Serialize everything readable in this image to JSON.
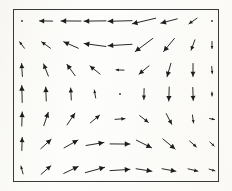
{
  "figure": {
    "title": "",
    "background_color": "#fdfdfb",
    "border_color": "#3a3a3a",
    "arrow_color": "#1d1d1d",
    "width": 232,
    "height": 191
  },
  "plot_frame": {
    "left": 13,
    "top": 9,
    "width": 206,
    "height": 173,
    "border_width": 1
  },
  "chart_data": {
    "type": "quiver",
    "title": "",
    "subtitle": "",
    "xlabel": "",
    "ylabel": "",
    "xlim": [
      0,
      8
    ],
    "ylim": [
      0,
      6
    ],
    "grid": false,
    "legend": null,
    "annotations": [],
    "n_cols": 9,
    "n_rows": 7,
    "origins_x": [
      22,
      46,
      71,
      95,
      120,
      144,
      169,
      193,
      212
    ],
    "origins_y": [
      21,
      45,
      70,
      94,
      119,
      144,
      170
    ],
    "cells": [
      [
        {
          "col": 0,
          "row": 0,
          "angle_deg": 180,
          "length": 3,
          "x": 0,
          "y": 6,
          "u": -0.1,
          "v": 0.0
        },
        {
          "col": 1,
          "row": 0,
          "angle_deg": 180,
          "length": 13,
          "x": 1,
          "y": 6,
          "u": -0.55,
          "v": 0.02
        },
        {
          "col": 2,
          "row": 0,
          "angle_deg": 180,
          "length": 20,
          "x": 2,
          "y": 6,
          "u": -0.85,
          "v": 0.02
        },
        {
          "col": 3,
          "row": 0,
          "angle_deg": 180,
          "length": 22,
          "x": 3,
          "y": 6,
          "u": -0.95,
          "v": 0.02
        },
        {
          "col": 4,
          "row": 0,
          "angle_deg": 182,
          "length": 24,
          "x": 4,
          "y": 6,
          "u": -1.0,
          "v": 0.04
        },
        {
          "col": 5,
          "row": 0,
          "angle_deg": 191,
          "length": 24,
          "x": 5,
          "y": 6,
          "u": -0.95,
          "v": 0.2
        },
        {
          "col": 6,
          "row": 0,
          "angle_deg": 196,
          "length": 17,
          "x": 6,
          "y": 6,
          "u": -0.7,
          "v": 0.22
        },
        {
          "col": 7,
          "row": 0,
          "angle_deg": 216,
          "length": 10,
          "x": 7,
          "y": 6,
          "u": -0.34,
          "v": 0.28
        },
        {
          "col": 8,
          "row": 0,
          "angle_deg": 0,
          "length": 3,
          "x": 8,
          "y": 6,
          "u": 0.08,
          "v": 0.0
        }
      ],
      [
        {
          "col": 0,
          "row": 1,
          "angle_deg": 128,
          "length": 8,
          "x": 0,
          "y": 5,
          "u": -0.22,
          "v": -0.28
        },
        {
          "col": 1,
          "row": 1,
          "angle_deg": 143,
          "length": 11,
          "x": 1,
          "y": 5,
          "u": -0.38,
          "v": -0.28
        },
        {
          "col": 2,
          "row": 1,
          "angle_deg": 157,
          "length": 16,
          "x": 2,
          "y": 5,
          "u": -0.6,
          "v": -0.25
        },
        {
          "col": 3,
          "row": 1,
          "angle_deg": 172,
          "length": 22,
          "x": 3,
          "y": 5,
          "u": -0.9,
          "v": -0.12
        },
        {
          "col": 4,
          "row": 1,
          "angle_deg": 185,
          "length": 24,
          "x": 4,
          "y": 5,
          "u": -0.95,
          "v": 0.1
        },
        {
          "col": 5,
          "row": 1,
          "angle_deg": 218,
          "length": 22,
          "x": 5,
          "y": 5,
          "u": -0.72,
          "v": 0.58
        },
        {
          "col": 6,
          "row": 1,
          "angle_deg": 232,
          "length": 17,
          "x": 6,
          "y": 5,
          "u": -0.45,
          "v": 0.58
        },
        {
          "col": 7,
          "row": 1,
          "angle_deg": 250,
          "length": 11,
          "x": 7,
          "y": 5,
          "u": -0.16,
          "v": 0.45
        },
        {
          "col": 8,
          "row": 1,
          "angle_deg": 270,
          "length": 7,
          "x": 8,
          "y": 5,
          "u": 0.0,
          "v": 0.3
        }
      ],
      [
        {
          "col": 0,
          "row": 2,
          "angle_deg": 96,
          "length": 13,
          "x": 0,
          "y": 4,
          "u": -0.06,
          "v": -0.55
        },
        {
          "col": 1,
          "row": 2,
          "angle_deg": 112,
          "length": 13,
          "x": 1,
          "y": 4,
          "u": -0.2,
          "v": -0.48
        },
        {
          "col": 2,
          "row": 2,
          "angle_deg": 125,
          "length": 14,
          "x": 2,
          "y": 4,
          "u": -0.34,
          "v": -0.48
        },
        {
          "col": 3,
          "row": 2,
          "angle_deg": 143,
          "length": 13,
          "x": 3,
          "y": 4,
          "u": -0.44,
          "v": -0.33
        },
        {
          "col": 4,
          "row": 2,
          "angle_deg": 180,
          "length": 8,
          "x": 4,
          "y": 4,
          "u": -0.33,
          "v": 0.0
        },
        {
          "col": 5,
          "row": 2,
          "angle_deg": 222,
          "length": 13,
          "x": 5,
          "y": 4,
          "u": -0.4,
          "v": 0.36
        },
        {
          "col": 6,
          "row": 2,
          "angle_deg": 252,
          "length": 14,
          "x": 6,
          "y": 4,
          "u": -0.18,
          "v": 0.55
        },
        {
          "col": 7,
          "row": 2,
          "angle_deg": 272,
          "length": 13,
          "x": 7,
          "y": 4,
          "u": 0.02,
          "v": 0.55
        },
        {
          "col": 8,
          "row": 2,
          "angle_deg": 272,
          "length": 7,
          "x": 8,
          "y": 4,
          "u": 0.02,
          "v": 0.3
        }
      ],
      [
        {
          "col": 0,
          "row": 3,
          "angle_deg": 90,
          "length": 17,
          "x": 0,
          "y": 3,
          "u": 0.0,
          "v": -0.72
        },
        {
          "col": 1,
          "row": 3,
          "angle_deg": 90,
          "length": 14,
          "x": 1,
          "y": 3,
          "u": 0.0,
          "v": -0.6
        },
        {
          "col": 2,
          "row": 3,
          "angle_deg": 92,
          "length": 12,
          "x": 2,
          "y": 3,
          "u": -0.02,
          "v": -0.5
        },
        {
          "col": 3,
          "row": 3,
          "angle_deg": 100,
          "length": 8,
          "x": 3,
          "y": 3,
          "u": -0.05,
          "v": -0.3
        },
        {
          "col": 4,
          "row": 3,
          "angle_deg": 0,
          "length": 2,
          "x": 4,
          "y": 3,
          "u": 0.0,
          "v": 0.0
        },
        {
          "col": 5,
          "row": 3,
          "angle_deg": 270,
          "length": 11,
          "x": 5,
          "y": 3,
          "u": 0.0,
          "v": 0.45
        },
        {
          "col": 6,
          "row": 3,
          "angle_deg": 270,
          "length": 14,
          "x": 6,
          "y": 3,
          "u": 0.0,
          "v": 0.58
        },
        {
          "col": 7,
          "row": 3,
          "angle_deg": 270,
          "length": 13,
          "x": 7,
          "y": 3,
          "u": 0.0,
          "v": 0.55
        },
        {
          "col": 8,
          "row": 3,
          "angle_deg": 270,
          "length": 4,
          "x": 8,
          "y": 3,
          "u": 0.0,
          "v": 0.15
        }
      ],
      [
        {
          "col": 0,
          "row": 4,
          "angle_deg": 87,
          "length": 14,
          "x": 0,
          "y": 2,
          "u": 0.03,
          "v": -0.58
        },
        {
          "col": 1,
          "row": 4,
          "angle_deg": 70,
          "length": 14,
          "x": 1,
          "y": 2,
          "u": 0.18,
          "v": -0.5
        },
        {
          "col": 2,
          "row": 4,
          "angle_deg": 58,
          "length": 14,
          "x": 2,
          "y": 2,
          "u": 0.28,
          "v": -0.45
        },
        {
          "col": 3,
          "row": 4,
          "angle_deg": 38,
          "length": 12,
          "x": 3,
          "y": 2,
          "u": 0.4,
          "v": -0.3
        },
        {
          "col": 4,
          "row": 4,
          "angle_deg": 3,
          "length": 10,
          "x": 4,
          "y": 2,
          "u": 0.42,
          "v": -0.02
        },
        {
          "col": 5,
          "row": 4,
          "angle_deg": 320,
          "length": 11,
          "x": 5,
          "y": 2,
          "u": 0.36,
          "v": 0.3
        },
        {
          "col": 6,
          "row": 4,
          "angle_deg": 296,
          "length": 12,
          "x": 6,
          "y": 2,
          "u": 0.22,
          "v": 0.45
        },
        {
          "col": 7,
          "row": 4,
          "angle_deg": 278,
          "length": 8,
          "x": 7,
          "y": 2,
          "u": 0.04,
          "v": 0.33
        },
        {
          "col": 8,
          "row": 4,
          "angle_deg": 350,
          "length": 5,
          "x": 8,
          "y": 2,
          "u": 0.2,
          "v": -0.04
        }
      ],
      [
        {
          "col": 0,
          "row": 5,
          "angle_deg": 86,
          "length": 13,
          "x": 0,
          "y": 1,
          "u": 0.04,
          "v": -0.55
        },
        {
          "col": 1,
          "row": 5,
          "angle_deg": 42,
          "length": 14,
          "x": 1,
          "y": 1,
          "u": 0.42,
          "v": -0.38
        },
        {
          "col": 2,
          "row": 5,
          "angle_deg": 32,
          "length": 16,
          "x": 2,
          "y": 1,
          "u": 0.56,
          "v": -0.35
        },
        {
          "col": 3,
          "row": 5,
          "angle_deg": 10,
          "length": 18,
          "x": 3,
          "y": 1,
          "u": 0.74,
          "v": -0.13
        },
        {
          "col": 4,
          "row": 5,
          "angle_deg": 2,
          "length": 20,
          "x": 4,
          "y": 1,
          "u": 0.84,
          "v": -0.03
        },
        {
          "col": 5,
          "row": 5,
          "angle_deg": 335,
          "length": 17,
          "x": 5,
          "y": 1,
          "u": 0.64,
          "v": 0.3
        },
        {
          "col": 6,
          "row": 5,
          "angle_deg": 322,
          "length": 16,
          "x": 6,
          "y": 1,
          "u": 0.53,
          "v": 0.41
        },
        {
          "col": 7,
          "row": 5,
          "angle_deg": 318,
          "length": 9,
          "x": 7,
          "y": 1,
          "u": 0.28,
          "v": 0.25
        },
        {
          "col": 8,
          "row": 5,
          "angle_deg": 316,
          "length": 6,
          "x": 8,
          "y": 1,
          "u": 0.18,
          "v": 0.17
        }
      ],
      [
        {
          "col": 0,
          "row": 6,
          "angle_deg": 104,
          "length": 8,
          "x": 0,
          "y": 0,
          "u": -0.08,
          "v": -0.32
        },
        {
          "col": 1,
          "row": 6,
          "angle_deg": 39,
          "length": 13,
          "x": 1,
          "y": 0,
          "u": 0.4,
          "v": -0.33
        },
        {
          "col": 2,
          "row": 6,
          "angle_deg": 27,
          "length": 16,
          "x": 2,
          "y": 0,
          "u": 0.6,
          "v": -0.3
        },
        {
          "col": 3,
          "row": 6,
          "angle_deg": 13,
          "length": 20,
          "x": 3,
          "y": 0,
          "u": 0.82,
          "v": -0.19
        },
        {
          "col": 4,
          "row": 6,
          "angle_deg": 5,
          "length": 20,
          "x": 4,
          "y": 0,
          "u": 0.84,
          "v": -0.07
        },
        {
          "col": 5,
          "row": 6,
          "angle_deg": 352,
          "length": 16,
          "x": 5,
          "y": 0,
          "u": 0.67,
          "v": 0.09
        },
        {
          "col": 6,
          "row": 6,
          "angle_deg": 350,
          "length": 14,
          "x": 6,
          "y": 0,
          "u": 0.58,
          "v": 0.1
        },
        {
          "col": 7,
          "row": 6,
          "angle_deg": 348,
          "length": 10,
          "x": 7,
          "y": 0,
          "u": 0.41,
          "v": 0.09
        },
        {
          "col": 8,
          "row": 6,
          "angle_deg": 345,
          "length": 6,
          "x": 8,
          "y": 0,
          "u": 0.24,
          "v": 0.06
        }
      ]
    ]
  }
}
